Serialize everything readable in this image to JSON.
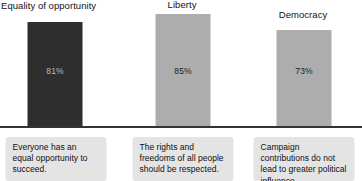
{
  "chart_data": {
    "type": "bar",
    "title": "",
    "xlabel": "",
    "ylabel": "",
    "ylim": [
      0,
      100
    ],
    "grid": false,
    "legend": "none",
    "categories": [
      "Equality of opportunity",
      "Liberty",
      "Democracy"
    ],
    "values": [
      81,
      85,
      73
    ],
    "value_labels": [
      "81%",
      "85%",
      "73%"
    ],
    "bar_colors": [
      "#2e2e2e",
      "#adadad",
      "#adadad"
    ],
    "annotations": [
      "Everyone has an equal opportunity to succeed.",
      "The rights and freedoms of all people should be respected.",
      "Campaign contributions do not lead to greater political influence."
    ]
  },
  "columns": [
    {
      "title": "Equality of opportunity",
      "value_label": "81%",
      "caption": "Everyone has an equal opportunity to succeed."
    },
    {
      "title": "Liberty",
      "value_label": "85%",
      "caption": "The rights and freedoms of all people should be respected."
    },
    {
      "title": "Democracy",
      "value_label": "73%",
      "caption": "Campaign contributions do not lead to greater political influence."
    }
  ]
}
